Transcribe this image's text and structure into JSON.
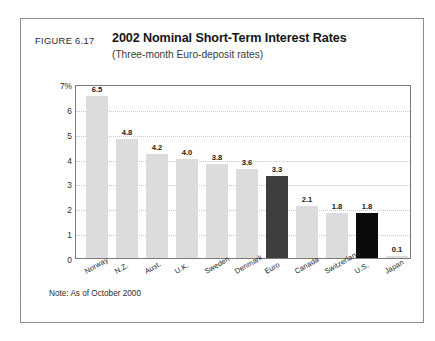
{
  "figure": {
    "number_label": "FIGURE 6.17",
    "title": "2002 Nominal Short-Term Interest Rates",
    "subtitle": "(Three-month Euro-deposit rates)",
    "note": "Note: As of October 2000",
    "source_credit": "Source: Datastream"
  },
  "colors": {
    "bar_default": "#dcdcdc",
    "bar_euro": "#3e3e3e",
    "bar_us": "#0a0a0a",
    "frame": "#7a7a7a",
    "gridline": "#c9c9c9"
  },
  "chart_data": {
    "type": "bar",
    "title": "2002 Nominal Short-Term Interest Rates",
    "subtitle": "(Three-month Euro-deposit rates)",
    "xlabel": "",
    "ylabel": "",
    "ylim": [
      0,
      7
    ],
    "ytick_labels": [
      "7%",
      "6",
      "5",
      "4",
      "3",
      "2",
      "1",
      "0"
    ],
    "ytick_values": [
      7,
      6,
      5,
      4,
      3,
      2,
      1,
      0
    ],
    "grid": true,
    "legend_position": "none",
    "categories": [
      "Norway",
      "N.Z.",
      "Aust.",
      "U.K.",
      "Sweden",
      "Denmark",
      "Euro",
      "Canada",
      "Switzerland",
      "U.S.",
      "Japan"
    ],
    "values": [
      6.5,
      4.8,
      4.2,
      4.0,
      3.8,
      3.6,
      3.3,
      2.1,
      1.8,
      1.8,
      0.1
    ],
    "value_labels": [
      "6.5",
      "4.8",
      "4.2",
      "4.0",
      "3.8",
      "3.6",
      "3.3",
      "2.1",
      "1.8",
      "1.8",
      "0.1"
    ],
    "bar_colors": [
      "#dcdcdc",
      "#dcdcdc",
      "#dcdcdc",
      "#dcdcdc",
      "#dcdcdc",
      "#dcdcdc",
      "#3e3e3e",
      "#dcdcdc",
      "#dcdcdc",
      "#0a0a0a",
      "#dcdcdc"
    ],
    "annotations": [
      "Note: As of October 2000"
    ]
  }
}
